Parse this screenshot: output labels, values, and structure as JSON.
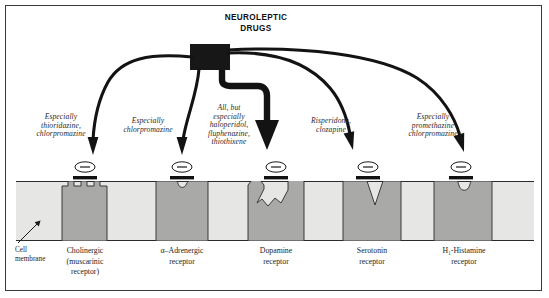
{
  "figure": {
    "title": "NEUROLEPTIC\nDRUGS",
    "colors": {
      "frame": "#3a3a3a",
      "drug_box": "#1a1a1a",
      "arrow": "#121212",
      "membrane_lipid": "#e3e3e1",
      "receptor_protein": "#a9a9a7",
      "text": "#1d1d1d"
    }
  },
  "drug_labels": [
    {
      "id": "cholinergic-drugs",
      "text": "Especially\nthioridazine,\nchlorpromazine"
    },
    {
      "id": "adrenergic-drugs",
      "text": "Especially\nchlorpromazine"
    },
    {
      "id": "dopamine-drugs",
      "text": "All, but\nespecially\nhaloperidol,\nfluphenazine,\nthiothixene"
    },
    {
      "id": "serotonin-drugs",
      "text": "Risperidone,\nclozapine"
    },
    {
      "id": "histamine-drugs",
      "text": "Especially\npromethazine\nchlorpromazine"
    }
  ],
  "receptors": [
    {
      "id": "cholinergic",
      "name": "Cholinergic\n(muscarinic\nreceptor)",
      "site_shape": "crenellated"
    },
    {
      "id": "adrenergic",
      "name": "α–Adrenergic\nreceptor",
      "site_shape": "small-round-notch"
    },
    {
      "id": "dopamine",
      "name": "Dopamine\nreceptor",
      "site_shape": "jagged-peaks"
    },
    {
      "id": "serotonin",
      "name": "Serotonin\nreceptor",
      "site_shape": "deep-v-notch"
    },
    {
      "id": "histamine",
      "name": "H₁-Histamine\nreceptor",
      "site_shape": "u-notch"
    }
  ],
  "annotations": {
    "cell_membrane": "Cell\nmembrane"
  },
  "drug_symbol": {
    "charge": "–",
    "count": 5
  }
}
